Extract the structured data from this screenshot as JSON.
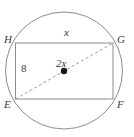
{
  "figure": {
    "shapes": {
      "circle": {
        "name": "circumscribed-circle",
        "cx": 64,
        "cy": 70.5,
        "r": 58.5
      },
      "rectangle": {
        "name": "rectangle-EFGH",
        "left": 15.5,
        "top": 43,
        "right": 113,
        "bottom": 99
      },
      "diagonal": {
        "name": "diagonal-EG",
        "x1": 15.5,
        "y1": 99,
        "x2": 113,
        "y2": 43,
        "style": "dashed"
      },
      "center_dot": {
        "name": "circle-center-point",
        "cx": 64,
        "cy": 71,
        "r": 3.2
      }
    },
    "colors": {
      "stroke": "#8c8c8c",
      "diagonal_stroke": "#9a9a9a",
      "center_dot": "#1a1a1a",
      "label": "#3a3a3a",
      "background": "#ffffff"
    },
    "labels": {
      "vertex_top_left": "H",
      "vertex_top_right": "G",
      "vertex_bottom_left": "E",
      "vertex_bottom_right": "F",
      "top_side": "x",
      "left_side": "8",
      "center": "2x"
    }
  }
}
